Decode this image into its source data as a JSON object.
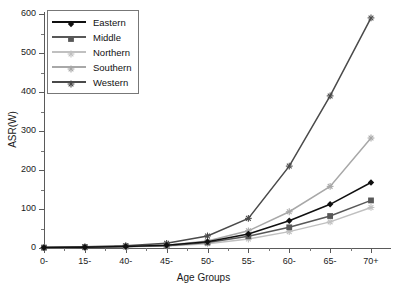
{
  "chart_data": {
    "type": "line",
    "title": "",
    "xlabel": "Age Groups",
    "ylabel": "ASR(W)",
    "categories": [
      "0-",
      "15-",
      "40-",
      "45-",
      "50-",
      "55-",
      "60-",
      "65-",
      "70+"
    ],
    "ylim": [
      0,
      600
    ],
    "yticks": [
      0,
      100,
      200,
      300,
      400,
      500,
      600
    ],
    "grid": false,
    "legend_position": "top-left",
    "series": [
      {
        "name": "Eastern",
        "color": "#101010",
        "marker": "diamond",
        "values": [
          1,
          2,
          4,
          7,
          16,
          36,
          70,
          112,
          168
        ]
      },
      {
        "name": "Middle",
        "color": "#585858",
        "marker": "square",
        "values": [
          1,
          2,
          4,
          6,
          14,
          30,
          53,
          82,
          122
        ]
      },
      {
        "name": "Northern",
        "color": "#c0c0c0",
        "marker": "star",
        "values": [
          1,
          2,
          3,
          5,
          11,
          23,
          42,
          67,
          104
        ]
      },
      {
        "name": "Southern",
        "color": "#a8a8a8",
        "marker": "star",
        "values": [
          1,
          2,
          4,
          7,
          18,
          44,
          93,
          158,
          282
        ]
      },
      {
        "name": "Western",
        "color": "#4a4a4a",
        "marker": "star",
        "values": [
          1,
          3,
          6,
          12,
          31,
          76,
          210,
          390,
          590
        ]
      }
    ]
  },
  "axes": {
    "y_tick_labels": [
      "0",
      "100",
      "200",
      "300",
      "400",
      "500",
      "600"
    ],
    "x_tick_labels": [
      "0-",
      "15-",
      "40-",
      "45-",
      "50-",
      "55-",
      "60-",
      "65-",
      "70+"
    ],
    "x_title": "Age Groups",
    "y_title": "ASR(W)"
  },
  "legend": {
    "items": [
      {
        "label": "Eastern"
      },
      {
        "label": "Middle"
      },
      {
        "label": "Northern"
      },
      {
        "label": "Southern"
      },
      {
        "label": "Western"
      }
    ]
  }
}
